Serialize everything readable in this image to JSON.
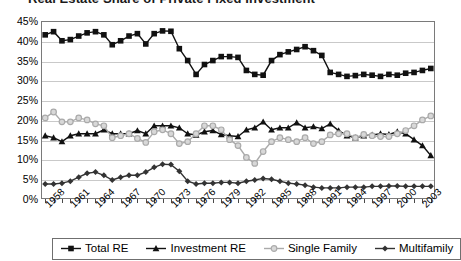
{
  "chart_data": {
    "type": "line",
    "title": "Real Estate Share of Private Fixed Investment",
    "xlabel": "",
    "ylabel": "",
    "ylim": [
      0,
      45
    ],
    "ytick_labels": [
      "45%",
      "40%",
      "35%",
      "30%",
      "25%",
      "20%",
      "15%",
      "10%",
      "5%",
      "0%"
    ],
    "ytick_values": [
      45,
      40,
      35,
      30,
      25,
      20,
      15,
      10,
      5,
      0
    ],
    "grid": true,
    "legend_position": "bottom",
    "x_start": 1958,
    "x_end": 2004,
    "xtick_labels": [
      "1958",
      "1961",
      "1964",
      "1967",
      "1970",
      "1973",
      "1976",
      "1979",
      "1982",
      "1985",
      "1988",
      "1991",
      "1994",
      "1997",
      "2000",
      "2003"
    ],
    "x": [
      1958,
      1959,
      1960,
      1961,
      1962,
      1963,
      1964,
      1965,
      1966,
      1967,
      1968,
      1969,
      1970,
      1971,
      1972,
      1973,
      1974,
      1975,
      1976,
      1977,
      1978,
      1979,
      1980,
      1981,
      1982,
      1983,
      1984,
      1985,
      1986,
      1987,
      1988,
      1989,
      1990,
      1991,
      1992,
      1993,
      1994,
      1995,
      1996,
      1997,
      1998,
      1999,
      2000,
      2001,
      2002,
      2003,
      2004
    ],
    "series": [
      {
        "name": "Total RE",
        "marker": "filled-square",
        "color": "#111111",
        "values": [
          41.5,
          42.3,
          40.0,
          40.3,
          41.2,
          42.0,
          42.3,
          41.5,
          39.0,
          40.0,
          41.2,
          41.8,
          39.2,
          41.8,
          42.5,
          42.4,
          38.0,
          35.0,
          31.5,
          34.0,
          35.0,
          36.0,
          36.0,
          35.8,
          32.5,
          31.5,
          31.3,
          35.0,
          36.5,
          37.2,
          37.8,
          38.5,
          37.5,
          36.3,
          32.0,
          31.5,
          31.0,
          31.2,
          31.5,
          31.3,
          31.0,
          31.5,
          31.3,
          31.8,
          32.0,
          32.5,
          33.0
        ]
      },
      {
        "name": "Investment RE",
        "marker": "filled-triangle",
        "color": "#111111",
        "values": [
          16.0,
          15.5,
          14.5,
          16.0,
          16.5,
          16.5,
          16.5,
          17.5,
          16.5,
          16.5,
          16.5,
          17.3,
          16.5,
          18.5,
          18.5,
          18.5,
          18.0,
          16.5,
          16.2,
          17.0,
          17.3,
          16.3,
          16.0,
          15.8,
          17.5,
          18.0,
          19.5,
          17.5,
          18.0,
          18.0,
          19.3,
          18.0,
          18.3,
          17.8,
          19.0,
          17.3,
          16.0,
          15.5,
          16.0,
          16.2,
          16.5,
          16.3,
          17.0,
          16.5,
          15.0,
          13.5,
          11.0
        ]
      },
      {
        "name": "Single Family",
        "marker": "open-circle",
        "color": "#aaaaaa",
        "values": [
          20.5,
          22.0,
          19.5,
          19.5,
          20.5,
          20.0,
          19.0,
          18.5,
          15.5,
          16.0,
          16.5,
          15.3,
          14.3,
          17.0,
          17.5,
          16.5,
          14.0,
          14.5,
          16.5,
          18.5,
          18.5,
          17.5,
          15.0,
          13.5,
          10.5,
          9.0,
          12.0,
          14.5,
          15.5,
          15.0,
          14.5,
          15.5,
          14.0,
          14.5,
          16.2,
          16.5,
          16.5,
          15.5,
          16.3,
          16.0,
          15.8,
          15.8,
          16.5,
          17.3,
          18.5,
          20.0,
          21.0
        ]
      },
      {
        "name": "Multifamily",
        "marker": "filled-diamond",
        "color": "#333333",
        "values": [
          3.8,
          3.8,
          4.0,
          4.5,
          5.5,
          6.5,
          6.8,
          6.0,
          4.8,
          5.5,
          6.0,
          6.0,
          6.8,
          8.0,
          8.8,
          8.7,
          7.0,
          4.5,
          3.8,
          4.0,
          4.0,
          4.2,
          4.2,
          4.0,
          4.5,
          4.8,
          5.2,
          5.0,
          4.5,
          4.0,
          3.8,
          3.5,
          3.0,
          2.8,
          2.8,
          2.8,
          3.0,
          3.0,
          3.0,
          3.2,
          3.2,
          3.3,
          3.3,
          3.2,
          3.2,
          3.2,
          3.2
        ]
      }
    ]
  },
  "legend": {
    "items": [
      {
        "label": "Total RE"
      },
      {
        "label": "Investment RE"
      },
      {
        "label": "Single Family"
      },
      {
        "label": "Multifamily"
      }
    ]
  }
}
